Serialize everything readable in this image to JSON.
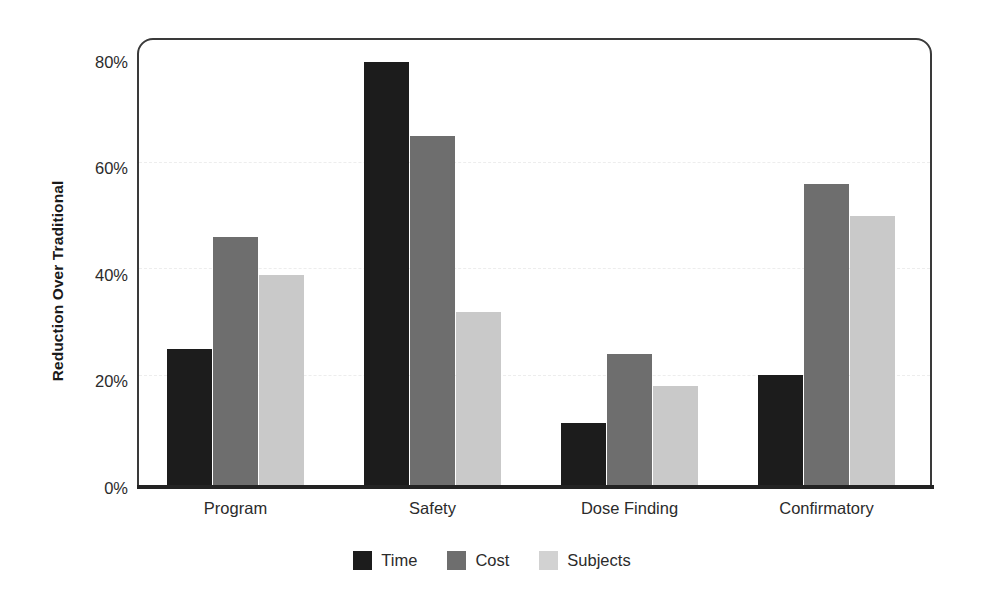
{
  "chart_data": {
    "type": "bar",
    "title": "",
    "xlabel": "",
    "ylabel": "Reduction Over Traditional",
    "categories": [
      "Program",
      "Safety",
      "Dose Finding",
      "Confirmatory"
    ],
    "series": [
      {
        "name": "Time",
        "color": "#1c1c1c",
        "values": [
          26,
          80,
          12,
          21
        ]
      },
      {
        "name": "Cost",
        "color": "#6e6e6e",
        "values": [
          47,
          66,
          25,
          57
        ]
      },
      {
        "name": "Subjects",
        "color": "#c9c9c9",
        "values": [
          40,
          33,
          19,
          51
        ]
      }
    ],
    "ylim": [
      0,
      80
    ],
    "yticks": [
      0,
      20,
      40,
      60,
      80
    ],
    "ytick_labels": [
      "0%",
      "20%",
      "40%",
      "60%",
      "80%"
    ],
    "grid": true,
    "gridlines_at": [
      20,
      40,
      60
    ],
    "legend_position": "bottom",
    "value_format": "percent"
  }
}
